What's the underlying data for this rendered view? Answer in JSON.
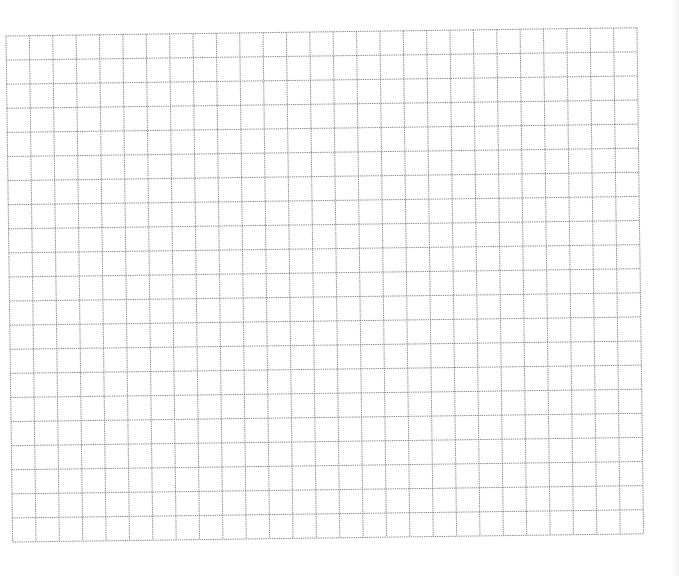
{
  "sheet": {
    "type": "grid-paper",
    "background": "#ffffff",
    "line_color": "#6f6f6f",
    "line_style": "dotted",
    "columns": 27,
    "rows": 21,
    "cell_width": 23.37,
    "cell_height": 24.1,
    "origin_x": 6,
    "origin_y": 36,
    "rotation_deg": -0.75
  }
}
